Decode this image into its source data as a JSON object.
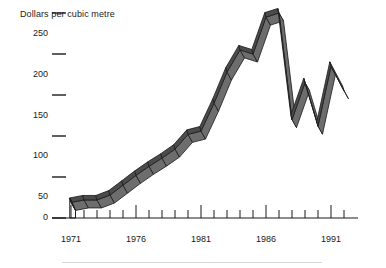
{
  "chart_data": {
    "type": "line",
    "title": "",
    "ylabel": "Dollars per cubic metre",
    "xlabel": "",
    "ylim": [
      0,
      250
    ],
    "xlim": [
      1971,
      1992
    ],
    "grid": false,
    "legend": "none",
    "style": "3d-ribbon",
    "y_ticks": [
      0,
      50,
      100,
      150,
      200,
      250
    ],
    "y_tick_labels": [
      "0",
      "50",
      "100",
      "150",
      "200",
      "250"
    ],
    "x_ticks": [
      1971,
      1972,
      1973,
      1974,
      1975,
      1976,
      1977,
      1978,
      1979,
      1980,
      1981,
      1982,
      1983,
      1984,
      1985,
      1986,
      1987,
      1988,
      1989,
      1990,
      1991,
      1992
    ],
    "x_tick_labels_shown": [
      "1971",
      "1976",
      "1981",
      "1986",
      "1991"
    ],
    "x_labeled_years": [
      1971,
      1976,
      1981,
      1986,
      1991
    ],
    "series": [
      {
        "name": "Dollars per cubic metre",
        "x": [
          1971,
          1972,
          1973,
          1974,
          1975,
          1976,
          1977,
          1978,
          1979,
          1980,
          1981,
          1982,
          1983,
          1984,
          1985,
          1986,
          1987,
          1988,
          1989,
          1990,
          1991,
          1992
        ],
        "values": [
          19,
          22,
          22,
          28,
          40,
          52,
          63,
          73,
          84,
          102,
          106,
          140,
          178,
          205,
          200,
          245,
          250,
          120,
          165,
          112,
          185,
          155
        ]
      }
    ],
    "colors": {
      "ribbon_top": "#4b4b4b",
      "ribbon_side": "#6d6d6d",
      "ribbon_outline": "#1a1a1a",
      "axis": "#1a1a1a",
      "text": "#1a1a1a",
      "background": "#ffffff",
      "footer_rule": "#d8d8d8"
    }
  },
  "axis": {
    "y_title": "Dollars per cubic metre",
    "y_labels": [
      "250",
      "200",
      "150",
      "100",
      "50",
      "0"
    ],
    "x_labels": [
      "1971",
      "1976",
      "1981",
      "1986",
      "1991"
    ]
  }
}
